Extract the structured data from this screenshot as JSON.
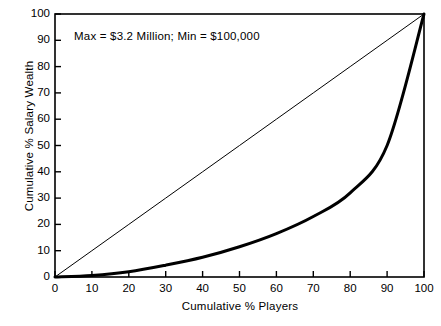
{
  "chart_data": {
    "type": "line",
    "title": "",
    "annotation": "Max  =  $3.2 Million;  Min  =  $100,000",
    "xlabel": "Cumulative % Players",
    "ylabel": "Cumulative % Salary Wealth",
    "xlim": [
      0,
      100
    ],
    "ylim": [
      0,
      100
    ],
    "grid": false,
    "legend": "none",
    "xticks": [
      "0",
      "10",
      "20",
      "30",
      "40",
      "50",
      "60",
      "70",
      "80",
      "90",
      "100"
    ],
    "yticks": [
      "0",
      "10",
      "20",
      "30",
      "40",
      "50",
      "60",
      "70",
      "80",
      "90",
      "100"
    ],
    "x": [
      0,
      10,
      20,
      30,
      40,
      50,
      60,
      70,
      80,
      90,
      100
    ],
    "series": [
      {
        "name": "Line of equality",
        "style": "thin",
        "values": [
          0,
          10,
          20,
          30,
          40,
          50,
          60,
          70,
          80,
          90,
          100
        ]
      },
      {
        "name": "Lorenz curve of salary wealth",
        "style": "thick",
        "values": [
          0,
          0.6,
          2,
          4.5,
          7.5,
          11.5,
          16.5,
          23,
          32,
          50,
          100
        ]
      }
    ],
    "colors": {
      "axis": "#000000",
      "equality_line": "#000000",
      "lorenz_curve": "#000000",
      "background": "#ffffff"
    }
  },
  "axes": {
    "plot_left_px": 55,
    "plot_right_px": 424,
    "plot_top_px": 14,
    "plot_bottom_px": 277
  }
}
